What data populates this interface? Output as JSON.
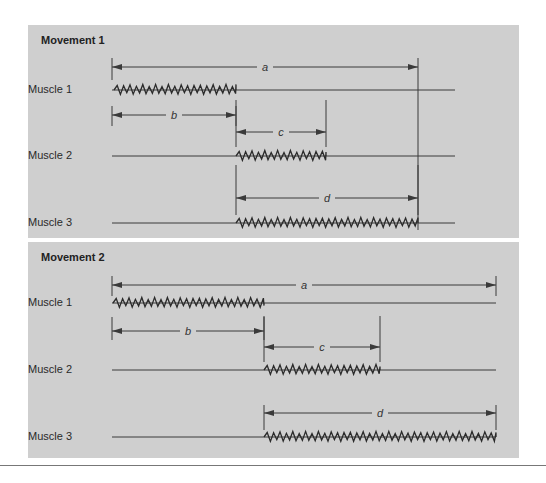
{
  "colors": {
    "panel_bg": "#cfcfcf",
    "line": "#3a3a3a",
    "text": "#222222"
  },
  "panels": [
    {
      "title": "Movement 1",
      "top": 25,
      "height": 213,
      "muscles": [
        {
          "label": "Muscle 1",
          "y": 90,
          "baseline": [
            112,
            455
          ],
          "burst": [
            114,
            236
          ]
        },
        {
          "label": "Muscle 2",
          "y": 156,
          "baseline": [
            112,
            455
          ],
          "burst": [
            236,
            326
          ]
        },
        {
          "label": "Muscle 3",
          "y": 223,
          "baseline": [
            112,
            455
          ],
          "burst": [
            236,
            418
          ]
        }
      ],
      "intervals": [
        {
          "label": "a",
          "y": 67,
          "x1": 112,
          "x2": 418,
          "tick_top": 58,
          "tick_bot_left": 80,
          "tick_bot_right": 230
        },
        {
          "label": "b",
          "y": 115,
          "x1": 112,
          "x2": 236,
          "tick_top": 106,
          "tick_bot": 126
        },
        {
          "label": "c",
          "y": 132,
          "x1": 236,
          "x2": 326,
          "tick_top": 100,
          "tick_bot": 147
        },
        {
          "label": "d",
          "y": 198,
          "x1": 236,
          "x2": 418,
          "tick_top": 165,
          "tick_bot": 215
        }
      ]
    },
    {
      "title": "Movement 2",
      "top": 242,
      "height": 216,
      "muscles": [
        {
          "label": "Muscle 1",
          "y": 303,
          "baseline": [
            112,
            496
          ],
          "burst": [
            113,
            264
          ]
        },
        {
          "label": "Muscle 2",
          "y": 370,
          "baseline": [
            112,
            496
          ],
          "burst": [
            264,
            380
          ]
        },
        {
          "label": "Muscle 3",
          "y": 437,
          "baseline": [
            112,
            496
          ],
          "burst": [
            264,
            496
          ]
        }
      ],
      "intervals": [
        {
          "label": "a",
          "y": 285,
          "x1": 112,
          "x2": 496,
          "tick_top": 276,
          "tick_bot": 296
        },
        {
          "label": "b",
          "y": 331,
          "x1": 112,
          "x2": 264,
          "tick_top": 317,
          "tick_bot": 340
        },
        {
          "label": "c",
          "y": 347,
          "x1": 264,
          "x2": 380,
          "tick_top": 316,
          "tick_bot": 362
        },
        {
          "label": "d",
          "y": 413,
          "x1": 264,
          "x2": 496,
          "tick_top": 405,
          "tick_bot": 430
        }
      ]
    }
  ]
}
